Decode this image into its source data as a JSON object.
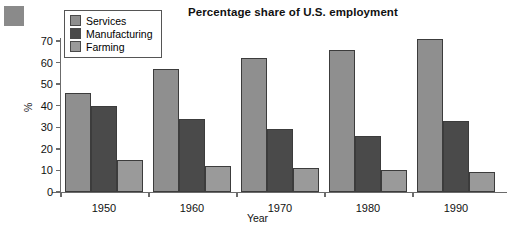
{
  "chart_data": {
    "type": "bar",
    "title": "Percentage share of U.S. employment",
    "xlabel": "Year",
    "ylabel": "%",
    "categories": [
      "1950",
      "1960",
      "1970",
      "1980",
      "1990"
    ],
    "series": [
      {
        "name": "Services",
        "color": "#8f8f8f",
        "values": [
          46,
          57,
          62,
          66,
          71
        ]
      },
      {
        "name": "Manufacturing",
        "color": "#4a4a4a",
        "values": [
          40,
          34,
          29,
          26,
          33
        ]
      },
      {
        "name": "Farming",
        "color": "#9a9a9a",
        "values": [
          15,
          12,
          11,
          10,
          9.5
        ]
      }
    ],
    "ylim": [
      0,
      70
    ],
    "yticks": [
      0,
      10,
      20,
      30,
      40,
      50,
      60,
      70
    ],
    "grid": false,
    "legend_position": "top-left"
  },
  "legend": {
    "items": [
      {
        "label": "Services"
      },
      {
        "label": "Manufacturing"
      },
      {
        "label": "Farming"
      }
    ]
  },
  "decoration": {
    "corner_square_color": "#8a8a8a"
  }
}
